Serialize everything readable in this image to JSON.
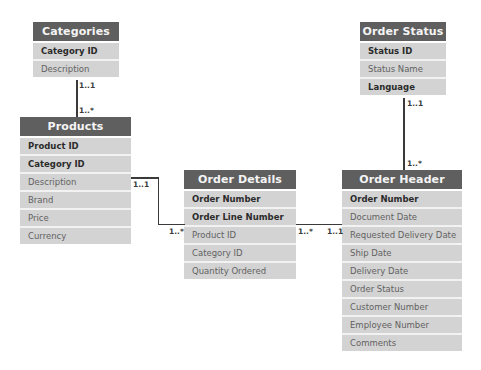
{
  "diagram": {
    "type": "entity-relationship",
    "entities": {
      "categories": {
        "title": "Categories",
        "fields": [
          {
            "name": "Category ID",
            "key": true
          },
          {
            "name": "Description",
            "key": false
          }
        ]
      },
      "products": {
        "title": "Products",
        "fields": [
          {
            "name": "Product ID",
            "key": true
          },
          {
            "name": "Category ID",
            "key": true
          },
          {
            "name": "Description",
            "key": false
          },
          {
            "name": "Brand",
            "key": false
          },
          {
            "name": "Price",
            "key": false
          },
          {
            "name": "Currency",
            "key": false
          }
        ]
      },
      "order_details": {
        "title": "Order Details",
        "fields": [
          {
            "name": "Order Number",
            "key": true
          },
          {
            "name": "Order Line Number",
            "key": true
          },
          {
            "name": "Product ID",
            "key": false
          },
          {
            "name": "Category ID",
            "key": false
          },
          {
            "name": "Quantity Ordered",
            "key": false
          }
        ]
      },
      "order_status": {
        "title": "Order Status",
        "fields": [
          {
            "name": "Status ID",
            "key": true
          },
          {
            "name": "Status Name",
            "key": false
          },
          {
            "name": "Language",
            "key": true
          }
        ]
      },
      "order_header": {
        "title": "Order Header",
        "fields": [
          {
            "name": "Order Number",
            "key": true
          },
          {
            "name": "Document Date",
            "key": false
          },
          {
            "name": "Requested Delivery Date",
            "key": false
          },
          {
            "name": "Ship Date",
            "key": false
          },
          {
            "name": "Delivery Date",
            "key": false
          },
          {
            "name": "Order Status",
            "key": false
          },
          {
            "name": "Customer Number",
            "key": false
          },
          {
            "name": "Employee Number",
            "key": false
          },
          {
            "name": "Comments",
            "key": false
          }
        ]
      }
    },
    "relationships": [
      {
        "from": "Categories",
        "to": "Products",
        "from_cardinality": "1..1",
        "to_cardinality": "1..*"
      },
      {
        "from": "Products",
        "to": "Order Details",
        "from_cardinality": "1..1",
        "to_cardinality": "1..*"
      },
      {
        "from": "Order Header",
        "to": "Order Details",
        "from_cardinality": "1..1",
        "to_cardinality": "1..*"
      },
      {
        "from": "Order Status",
        "to": "Order Header",
        "from_cardinality": "1..1",
        "to_cardinality": "1..*"
      }
    ],
    "colors": {
      "header_bg": "#5f5f5f",
      "header_text": "#f4f4f4",
      "row_bg": "#d3d3d3",
      "key_text": "#2b2b2b",
      "attr_text": "#626262",
      "connector": "#3a3a3a"
    }
  }
}
